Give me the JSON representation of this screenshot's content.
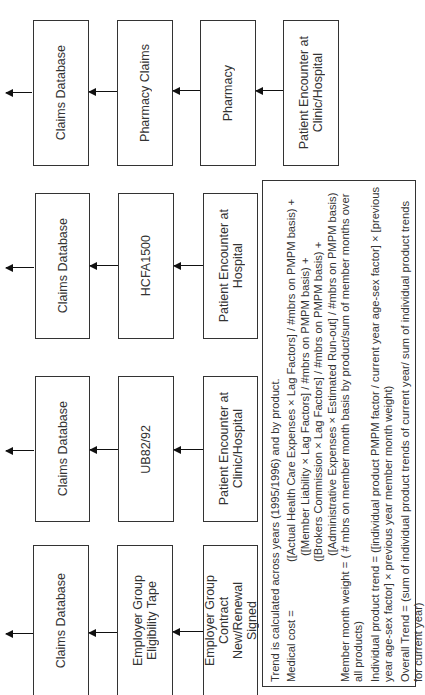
{
  "diagram": {
    "orientation": "rotated-90-ccw",
    "flows": [
      {
        "id": "pharmacy",
        "nodes": [
          "Claims Database",
          "Pharmacy Claims",
          "Pharmacy",
          "Patient Encounter at\nClinic/Hospital"
        ]
      },
      {
        "id": "hcfa",
        "nodes": [
          "Claims Database",
          "HCFA1500",
          "Patient Encounter at\nHospital"
        ]
      },
      {
        "id": "ub",
        "nodes": [
          "Claims Database",
          "UB82/92",
          "Patient Encounter at\nClinic/Hospital"
        ]
      },
      {
        "id": "eligibility",
        "nodes": [
          "Claims Database",
          "Employer Group\nEligibility Tape",
          "Employer Group\nContract\nNew/Renewal\nSigned"
        ]
      }
    ],
    "notes": {
      "intro": "Trend is calculated across years (1995/1996) and by product.",
      "medical_cost_label": "Medical cost =",
      "medical_cost_terms": [
        "([Actual Health Care Expenses × Lag Factors] / #mbrs on PMPM basis) +",
        "([Member Liability × Lag Factors]          / #mbrs on PMPM basis) +",
        "([Brokers Commission × Lag Factors]      / #mbrs on PMPM basis) +",
        "([Administrative Expenses × Estimated Run-out] / #mbrs on PMPM basis)"
      ],
      "member_month_weight": "Member month weight = ( # mbrs on member month basis by product/sum of member months over all products)",
      "individual_trend": "Individual product trend = ([individual product PMPM factor / current year age-sex factor] × [previous year age-sex factor] × previous year member month weight)",
      "overall_trend": "Overall Trend = (sum of individual product trends of current year/ sum of individual product trends for current year)"
    }
  }
}
